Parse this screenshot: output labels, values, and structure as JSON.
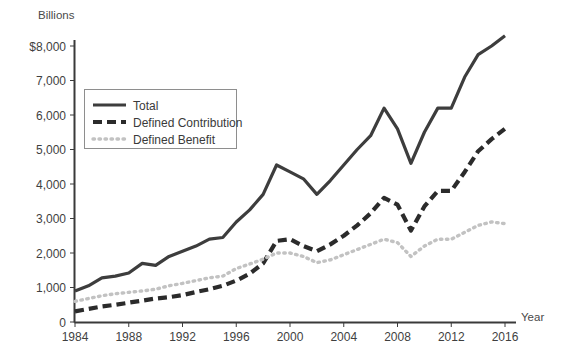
{
  "chart_data": {
    "type": "line",
    "title": "",
    "subtitle": "",
    "ylabel": "Billions",
    "xlabel": "Year",
    "grid": false,
    "legend_position": "upper-left-inside",
    "xlim": [
      1984,
      2016
    ],
    "ylim": [
      0,
      8000
    ],
    "x_tick_labels": [
      "1984",
      "1988",
      "1992",
      "1996",
      "2000",
      "2004",
      "2008",
      "2012",
      "2016"
    ],
    "x_ticks": [
      1984,
      1988,
      1992,
      1996,
      2000,
      2004,
      2008,
      2012,
      2016
    ],
    "y_tick_labels": [
      "0",
      "1,000",
      "2,000",
      "3,000",
      "4,000",
      "5,000",
      "6,000",
      "7,000",
      "$8,000"
    ],
    "y_ticks": [
      0,
      1000,
      2000,
      3000,
      4000,
      5000,
      6000,
      7000,
      8000
    ],
    "x": [
      1984,
      1985,
      1986,
      1987,
      1988,
      1989,
      1990,
      1991,
      1992,
      1993,
      1994,
      1995,
      1996,
      1997,
      1998,
      1999,
      2000,
      2001,
      2002,
      2003,
      2004,
      2005,
      2006,
      2007,
      2008,
      2009,
      2010,
      2011,
      2012,
      2013,
      2014,
      2015,
      2016
    ],
    "series": [
      {
        "name": "Total",
        "style": "solid",
        "color": "#3d3d3d",
        "values": [
          900,
          1050,
          1280,
          1330,
          1420,
          1700,
          1640,
          1900,
          2050,
          2200,
          2400,
          2450,
          2900,
          3250,
          3700,
          4550,
          4350,
          4150,
          3700,
          4100,
          4550,
          5000,
          5400,
          6200,
          5600,
          4600,
          5500,
          6200,
          6200,
          7100,
          7750,
          8000,
          8300
        ]
      },
      {
        "name": "Defined Contribution",
        "style": "dashed",
        "color": "#2b2b2b",
        "values": [
          310,
          380,
          450,
          500,
          560,
          620,
          680,
          720,
          780,
          870,
          950,
          1050,
          1200,
          1400,
          1700,
          2350,
          2400,
          2200,
          2050,
          2250,
          2500,
          2800,
          3150,
          3600,
          3400,
          2650,
          3350,
          3800,
          3800,
          4350,
          4950,
          5300,
          5600
        ]
      },
      {
        "name": "Defined Benefit",
        "style": "dotted",
        "color": "#c2c2c2",
        "values": [
          600,
          680,
          760,
          820,
          860,
          900,
          950,
          1050,
          1120,
          1200,
          1280,
          1330,
          1550,
          1680,
          1820,
          2000,
          2000,
          1900,
          1720,
          1800,
          1950,
          2100,
          2250,
          2400,
          2300,
          1900,
          2200,
          2400,
          2400,
          2600,
          2800,
          2900,
          2850
        ]
      }
    ]
  },
  "legend": {
    "items": [
      {
        "label": "Total",
        "key": "solid"
      },
      {
        "label": "Defined Contribution",
        "key": "dashed"
      },
      {
        "label": "Defined Benefit",
        "key": "dotted"
      }
    ]
  },
  "axes": {
    "y_axis_caption": "Billions",
    "x_axis_caption": "Year"
  }
}
